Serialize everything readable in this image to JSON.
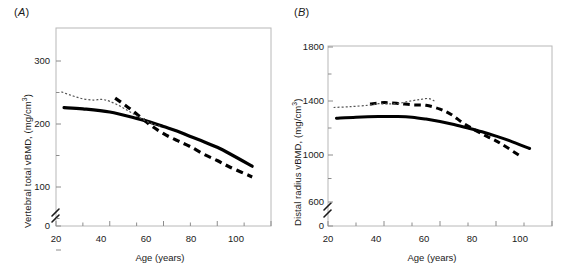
{
  "figure": {
    "background": "#ffffff",
    "panel_count": 2
  },
  "panels": {
    "a": {
      "label": "(",
      "label_letter": "A",
      "label_close": ")",
      "ylabel_main": "Vertebral total vBMD, (mg/cm",
      "ylabel_sup": "3",
      "ylabel_tail": ")",
      "xlabel": "Age (years)",
      "ytick_labels": [
        "0",
        "100",
        "200",
        "300"
      ],
      "xtick_labels": [
        "20",
        "40",
        "60",
        "80",
        "100"
      ]
    },
    "b": {
      "label": "(",
      "label_letter": "B",
      "label_close": ")",
      "ylabel_main": "Distal radius vBMD, (mg/cm",
      "ylabel_sup": "3",
      "ylabel_tail": ")",
      "xlabel": "Age (years)",
      "ytick_labels": [
        "0",
        "600",
        "1000",
        "1400",
        "1800"
      ],
      "xtick_labels": [
        "20",
        "40",
        "60",
        "80",
        "100"
      ]
    }
  },
  "colors": {
    "axis": "#b4b4b4",
    "tick": "#8c8c8c",
    "text": "#1a1a1a",
    "solid_curve": "#000000",
    "dashed_curve": "#000000",
    "dotted_curve": "#555555"
  },
  "chart_data": [
    {
      "type": "line",
      "panel": "A",
      "title": "(A)",
      "xlabel": "Age (years)",
      "ylabel": "Vertebral total vBMD, (mg/cm3)",
      "xlim": [
        20,
        100
      ],
      "ylim": [
        0,
        330
      ],
      "xticks": [
        20,
        40,
        60,
        80,
        100
      ],
      "yticks": [
        0,
        100,
        200,
        300
      ],
      "yticks_minor": [
        50,
        150,
        250
      ],
      "grid": false,
      "legend": "none",
      "axis_break": {
        "axis": "y",
        "between": [
          0,
          20
        ],
        "style": "double-slash"
      },
      "series": [
        {
          "name": "solid-thick",
          "style": "solid",
          "width": 3.2,
          "color": "#000000",
          "x": [
            23,
            30,
            40,
            50,
            55,
            60,
            65,
            70,
            75,
            80,
            85,
            93
          ],
          "y": [
            226,
            224,
            219,
            209,
            203,
            196,
            189,
            180,
            172,
            163,
            152,
            133
          ]
        },
        {
          "name": "dashed-thick",
          "style": "dashed",
          "width": 3.2,
          "color": "#000000",
          "x": [
            42,
            46,
            50,
            54,
            58,
            62,
            66,
            70,
            75,
            80,
            85,
            93
          ],
          "y": [
            241,
            229,
            216,
            202,
            190,
            180,
            172,
            164,
            152,
            142,
            131,
            116
          ]
        },
        {
          "name": "dotted-thin",
          "style": "dotted",
          "width": 1.2,
          "color": "#555555",
          "x": [
            22,
            26,
            30,
            34,
            37,
            40,
            44,
            48,
            52,
            56,
            59
          ],
          "y": [
            251,
            245,
            240,
            238,
            239,
            236,
            228,
            218,
            208,
            200,
            196
          ]
        }
      ]
    },
    {
      "type": "line",
      "panel": "B",
      "title": "(B)",
      "xlabel": "Age (years)",
      "ylabel": "Distal radius vBMD, (mg/cm3)",
      "xlim": [
        20,
        100
      ],
      "ylim": [
        0,
        1900
      ],
      "yticks": [
        0,
        600,
        1000,
        1400,
        1800
      ],
      "yticks_minor": [
        800,
        1200,
        1600
      ],
      "xticks": [
        20,
        40,
        60,
        80,
        100
      ],
      "grid": false,
      "legend": "none",
      "axis_break": {
        "axis": "y",
        "between": [
          0,
          600
        ],
        "style": "double-slash"
      },
      "series": [
        {
          "name": "solid-thick",
          "style": "solid",
          "width": 3.0,
          "color": "#000000",
          "x": [
            23,
            30,
            38,
            45,
            50,
            55,
            60,
            65,
            70,
            75,
            80,
            85,
            92
          ],
          "y": [
            1272,
            1280,
            1285,
            1285,
            1280,
            1266,
            1248,
            1226,
            1200,
            1172,
            1140,
            1105,
            1048
          ]
        },
        {
          "name": "dashed-thick",
          "style": "dashed",
          "width": 3.0,
          "color": "#000000",
          "x": [
            35,
            40,
            45,
            50,
            55,
            60,
            64,
            68,
            72,
            76,
            80,
            84,
            89
          ],
          "y": [
            1378,
            1388,
            1382,
            1372,
            1368,
            1340,
            1300,
            1240,
            1190,
            1145,
            1105,
            1055,
            985
          ]
        },
        {
          "name": "dotted-thin",
          "style": "dotted",
          "width": 1.2,
          "color": "#555555",
          "x": [
            22,
            28,
            34,
            38,
            41,
            45,
            49,
            53,
            56,
            58
          ],
          "y": [
            1352,
            1358,
            1368,
            1380,
            1378,
            1382,
            1398,
            1412,
            1418,
            1400
          ]
        }
      ]
    }
  ]
}
